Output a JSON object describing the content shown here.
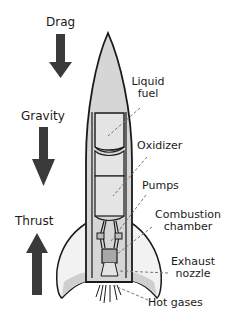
{
  "diagram": {
    "forces": [
      {
        "label": "Drag",
        "direction": "down"
      },
      {
        "label": "Gravity",
        "direction": "down"
      },
      {
        "label": "Thrust",
        "direction": "up"
      }
    ],
    "parts": [
      {
        "label_line1": "Liquid",
        "label_line2": "fuel"
      },
      {
        "label_line1": "Oxidizer"
      },
      {
        "label_line1": "Pumps"
      },
      {
        "label_line1": "Combustion",
        "label_line2": "chamber"
      },
      {
        "label_line1": "Exhaust",
        "label_line2": "nozzle"
      },
      {
        "label_line1": "Hot gases"
      }
    ]
  },
  "colors": {
    "arrow": "#3a3a3a",
    "outline": "#1a1a1a",
    "body_fill": "#d6d6d6",
    "tank_fill": "#e4e4e4",
    "fin_fill": "#f2f2f2",
    "leader": "#777777"
  }
}
